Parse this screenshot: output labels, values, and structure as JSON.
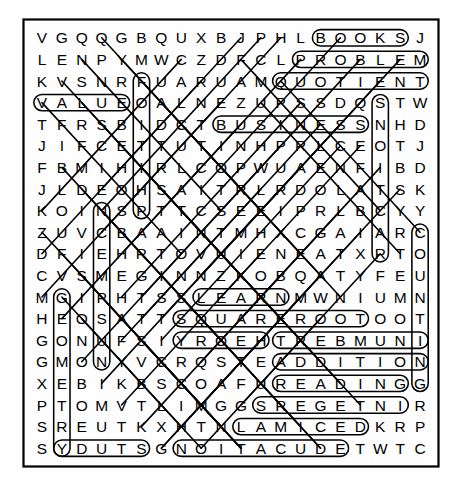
{
  "puzzle": {
    "type": "word-search",
    "rows": 20,
    "cols": 20,
    "ink_color": "#000000",
    "paper_color": "#ffffff",
    "grid": [
      "V G Q Q G B Q U X B J P H L B O O K S J",
      "L E N P Y M W C Z D F C L P R O B L E M",
      "K V S N R F U A R U A M Q U O T I E N T",
      "V A L U E O A L N E Z U P S S D Q S T W",
      "T F R S B I D C T B U S I N E S S N H D",
      "J I F C E T T U T I N H P R L C E O T J",
      "F B M I H I R L C O P W U A E N F I B D",
      "J L D E O H S A I T R L R D O L A T S K",
      "K O I N S P T T C S E E I P R L B C Y Y",
      "Z U V C B A A I N T M H X C G A I A R C",
      "D F I E H R T O V U I E N E A T X R T O",
      "C V S M E G I N N Z K O B Q A T Y F E U",
      "M G I P H T S S L E A R N M W N I U M N",
      "H E O S A T T S Q U A R E R O O T O O T",
      "G O N U F S I Y R O E H T R E B M U N I",
      "G M O N Y V C R Q S T E A D D I T I O N",
      "X E B I K B S C O A F U R E A D I N G G",
      "P T O M V T L I M G G S R E G E T N I R",
      "S R E U T K X H T N L A M I C E D K R P",
      "S Y D U T S G N O I T A C U D E T W T C"
    ],
    "found_words": [
      {
        "word": "BOOKS",
        "start_row": 1,
        "start_col": 15,
        "end_row": 1,
        "end_col": 19,
        "direction": "horizontal-right"
      },
      {
        "word": "PROBLEM",
        "start_row": 2,
        "start_col": 14,
        "end_row": 2,
        "end_col": 20,
        "direction": "horizontal-right"
      },
      {
        "word": "QUOTIENT",
        "start_row": 3,
        "start_col": 13,
        "end_row": 3,
        "end_col": 20,
        "direction": "horizontal-right"
      },
      {
        "word": "VALUE",
        "start_row": 4,
        "start_col": 1,
        "end_row": 4,
        "end_col": 5,
        "direction": "horizontal-right"
      },
      {
        "word": "BUSINESS",
        "start_row": 5,
        "start_col": 10,
        "end_row": 5,
        "end_col": 17,
        "direction": "horizontal-right"
      },
      {
        "word": "LEARN",
        "start_row": 13,
        "start_col": 9,
        "end_row": 13,
        "end_col": 13,
        "direction": "horizontal-right"
      },
      {
        "word": "SQUAREROOT",
        "start_row": 14,
        "start_col": 8,
        "end_row": 14,
        "end_col": 17,
        "direction": "horizontal-right"
      },
      {
        "word": "THEOREM",
        "start_row": 15,
        "start_col": 12,
        "end_row": 15,
        "end_col": 8,
        "direction": "horizontal-left"
      },
      {
        "word": "NUMBER",
        "start_row": 15,
        "start_col": 20,
        "end_row": 15,
        "end_col": 13,
        "direction": "horizontal-left"
      },
      {
        "word": "ADDITION",
        "start_row": 16,
        "start_col": 13,
        "end_row": 16,
        "end_col": 20,
        "direction": "horizontal-right"
      },
      {
        "word": "READING",
        "start_row": 17,
        "start_col": 13,
        "end_row": 17,
        "end_col": 19,
        "direction": "horizontal-right"
      },
      {
        "word": "INTEGERS",
        "start_row": 18,
        "start_col": 19,
        "end_row": 18,
        "end_col": 12,
        "direction": "horizontal-left"
      },
      {
        "word": "DECIMAL",
        "start_row": 19,
        "start_col": 17,
        "end_row": 19,
        "end_col": 11,
        "direction": "horizontal-left"
      },
      {
        "word": "STUDY",
        "start_row": 20,
        "start_col": 6,
        "end_row": 20,
        "end_col": 2,
        "direction": "horizontal-left"
      },
      {
        "word": "EDUCATION",
        "start_row": 20,
        "start_col": 16,
        "end_row": 20,
        "end_col": 8,
        "direction": "horizontal-left"
      },
      {
        "word": "COUNTING",
        "start_row": 10,
        "start_col": 20,
        "end_row": 17,
        "end_col": 20,
        "direction": "vertical-down"
      },
      {
        "word": "CONSTANT",
        "start_row": 9,
        "start_col": 4,
        "end_row": 16,
        "end_col": 4,
        "direction": "vertical-up"
      },
      {
        "word": "GEOMETRY",
        "start_row": 13,
        "start_col": 2,
        "end_row": 20,
        "end_col": 2,
        "direction": "vertical-down"
      },
      {
        "word": "SCIENCE",
        "start_row": 9,
        "start_col": 6,
        "end_row": 3,
        "end_col": 6,
        "direction": "vertical-up"
      },
      {
        "word": "SUBTRACT",
        "start_row": 4,
        "start_col": 18,
        "end_row": 11,
        "end_col": 18,
        "direction": "vertical-down"
      }
    ]
  }
}
